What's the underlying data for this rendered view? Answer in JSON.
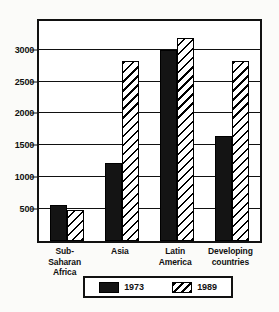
{
  "chart_data": {
    "type": "bar",
    "title": "",
    "subtitle": "",
    "xlabel": "",
    "ylabel": "",
    "categories": [
      "Sub-\nSaharan\nAfrica",
      "Asia",
      "Latin\nAmerica",
      "Developing\ncountries"
    ],
    "series": [
      {
        "name": "1973",
        "values": [
          560,
          1220,
          3000,
          1650
        ],
        "fill": "solid-black",
        "color": "#141414"
      },
      {
        "name": "1989",
        "values": [
          490,
          2820,
          3180,
          2830
        ],
        "fill": "diagonal-hatch",
        "color": "#ffffff"
      }
    ],
    "ylim": [
      0,
      3450
    ],
    "yticks": [
      500,
      1000,
      1500,
      2000,
      2500,
      3000
    ],
    "ytick_labels": [
      "500",
      "1000",
      "1500",
      "2000",
      "2500",
      "3000"
    ],
    "grid": true,
    "grid_axis": "y",
    "legend_position": "bottom-center",
    "frame": true
  },
  "legend": {
    "entries": [
      {
        "label": "1973"
      },
      {
        "label": "1989"
      }
    ]
  },
  "colors": {
    "ink": "#111111",
    "paper": "#fbfbf9",
    "plot_background": "#ffffff",
    "series_1973": "#141414",
    "series_1989": "#ffffff"
  }
}
